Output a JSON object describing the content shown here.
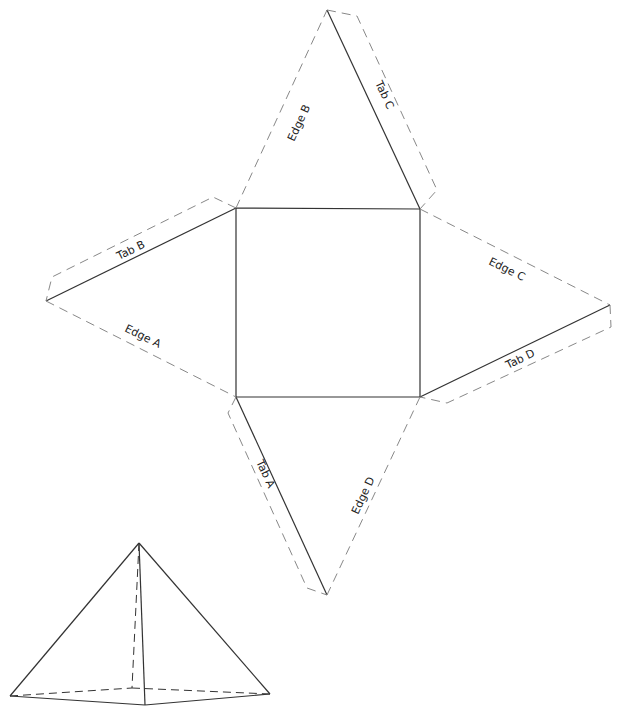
{
  "diagram": {
    "type": "pyramid-net",
    "faces": [
      "square base",
      "triangle top",
      "triangle left",
      "triangle right",
      "triangle bottom"
    ],
    "labels": {
      "edge_a": "Edge A",
      "edge_b": "Edge B",
      "edge_c": "Edge C",
      "edge_d": "Edge D",
      "tab_a": "Tab A",
      "tab_b": "Tab B",
      "tab_c": "Tab C",
      "tab_d": "Tab D"
    },
    "illustration": "assembled square pyramid"
  }
}
